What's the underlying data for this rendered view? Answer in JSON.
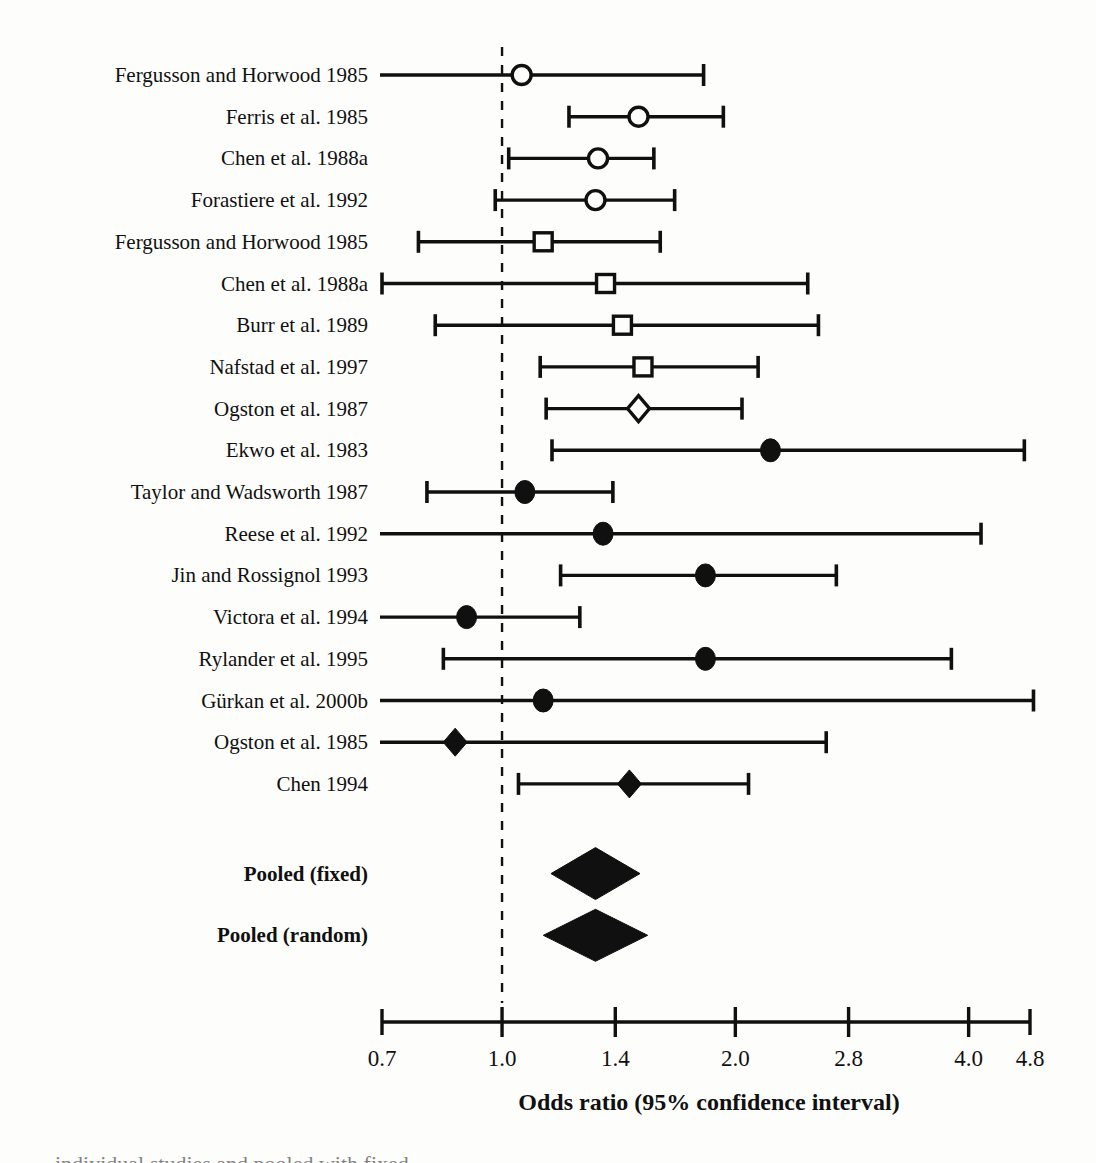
{
  "figure": {
    "type": "forest-plot",
    "background_color": "#fdfdfb",
    "ink_color": "#101010"
  },
  "axis": {
    "title": "Odds ratio (95% confidence interval)",
    "scale": "log",
    "min": 0.7,
    "max": 4.8,
    "ticks": [
      "0.7",
      "1.0",
      "1.4",
      "2.0",
      "2.8",
      "4.0",
      "4.8"
    ],
    "tick_values": [
      0.7,
      1.0,
      1.4,
      2.0,
      2.8,
      4.0,
      4.8
    ],
    "reference_line": 1.0,
    "reference_line_style": "dashed"
  },
  "chart_data": {
    "type": "forest",
    "title": "",
    "xlabel": "Odds ratio (95% confidence interval)",
    "ylabel": "",
    "xscale": "log",
    "xlim": [
      0.7,
      4.8
    ],
    "xticks": [
      0.7,
      1.0,
      1.4,
      2.0,
      2.8,
      4.0,
      4.8
    ],
    "xticklabels": [
      "0.7",
      "1.0",
      "1.4",
      "2.0",
      "2.8",
      "4.0",
      "4.8"
    ],
    "reference_line": 1.0,
    "grid": false,
    "legend": "none",
    "marker_types": [
      "open-circle",
      "open-square",
      "open-diamond",
      "filled-circle",
      "filled-diamond",
      "pooled-diamond"
    ],
    "rows": [
      {
        "label": "Fergusson and Horwood 1985",
        "or": 1.06,
        "lower": 0.6,
        "upper": 1.82,
        "marker": "open-circle",
        "left_clipped": true,
        "right_clipped": false
      },
      {
        "label": "Ferris et al. 1985",
        "or": 1.5,
        "lower": 1.22,
        "upper": 1.93,
        "marker": "open-circle",
        "left_clipped": false,
        "right_clipped": false
      },
      {
        "label": "Chen et al. 1988a",
        "or": 1.33,
        "lower": 1.02,
        "upper": 1.57,
        "marker": "open-circle",
        "left_clipped": false,
        "right_clipped": false
      },
      {
        "label": "Forastiere et al. 1992",
        "or": 1.32,
        "lower": 0.98,
        "upper": 1.67,
        "marker": "open-circle",
        "left_clipped": false,
        "right_clipped": false
      },
      {
        "label": "Fergusson and Horwood 1985",
        "or": 1.13,
        "lower": 0.78,
        "upper": 1.6,
        "marker": "open-square",
        "left_clipped": false,
        "right_clipped": false
      },
      {
        "label": "Chen et al. 1988a",
        "or": 1.36,
        "lower": 0.7,
        "upper": 2.48,
        "marker": "open-square",
        "left_clipped": false,
        "right_clipped": false
      },
      {
        "label": "Burr et al. 1989",
        "or": 1.43,
        "lower": 0.82,
        "upper": 2.56,
        "marker": "open-square",
        "left_clipped": false,
        "right_clipped": false
      },
      {
        "label": "Nafstad et al. 1997",
        "or": 1.52,
        "lower": 1.12,
        "upper": 2.14,
        "marker": "open-square",
        "left_clipped": false,
        "right_clipped": false
      },
      {
        "label": "Ogston et al. 1987",
        "or": 1.5,
        "lower": 1.14,
        "upper": 2.04,
        "marker": "open-diamond",
        "left_clipped": false,
        "right_clipped": false
      },
      {
        "label": "Ekwo et al. 1983",
        "or": 2.22,
        "lower": 1.16,
        "upper": 4.72,
        "marker": "filled-circle",
        "left_clipped": false,
        "right_clipped": false
      },
      {
        "label": "Taylor and Wadsworth 1987",
        "or": 1.07,
        "lower": 0.8,
        "upper": 1.39,
        "marker": "filled-circle",
        "left_clipped": false,
        "right_clipped": false
      },
      {
        "label": "Reese et al. 1992",
        "or": 1.35,
        "lower": 0.55,
        "upper": 4.15,
        "marker": "filled-circle",
        "left_clipped": true,
        "right_clipped": false
      },
      {
        "label": "Jin and Rossignol 1993",
        "or": 1.83,
        "lower": 1.19,
        "upper": 2.7,
        "marker": "filled-circle",
        "left_clipped": false,
        "right_clipped": false
      },
      {
        "label": "Victora et al. 1994",
        "or": 0.9,
        "lower": 0.52,
        "upper": 1.26,
        "marker": "filled-circle",
        "left_clipped": true,
        "right_clipped": false
      },
      {
        "label": "Rylander et al. 1995",
        "or": 1.83,
        "lower": 0.84,
        "upper": 3.8,
        "marker": "filled-circle",
        "left_clipped": false,
        "right_clipped": false
      },
      {
        "label": "Gürkan et al. 2000b",
        "or": 1.13,
        "lower": 0.5,
        "upper": 4.85,
        "marker": "filled-circle",
        "left_clipped": true,
        "right_clipped": false
      },
      {
        "label": "Ogston et al. 1985",
        "or": 0.87,
        "lower": 0.5,
        "upper": 2.62,
        "marker": "filled-diamond",
        "left_clipped": true,
        "right_clipped": false
      },
      {
        "label": "Chen 1994",
        "or": 1.46,
        "lower": 1.05,
        "upper": 2.08,
        "marker": "filled-diamond",
        "left_clipped": false,
        "right_clipped": false
      },
      {
        "label": "Pooled (fixed)",
        "or": 1.32,
        "lower": 1.26,
        "upper": 1.39,
        "marker": "pooled-diamond",
        "bold": true,
        "left_clipped": false,
        "right_clipped": false
      },
      {
        "label": "Pooled (random)",
        "or": 1.32,
        "lower": 1.23,
        "upper": 1.42,
        "marker": "pooled-diamond",
        "bold": true,
        "left_clipped": false,
        "right_clipped": false
      }
    ]
  }
}
